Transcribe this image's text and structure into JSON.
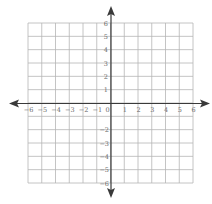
{
  "chart_data": {
    "type": "coordinate-plane",
    "title": "",
    "xlabel": "",
    "ylabel": "",
    "xlim": [
      -6,
      6
    ],
    "ylim": [
      -6,
      6
    ],
    "grid": true,
    "x_ticks": [
      "−6",
      "−5",
      "−4",
      "−3",
      "−2",
      "−1",
      "0",
      "1",
      "2",
      "3",
      "4",
      "5",
      "6"
    ],
    "y_ticks_positive": [
      "1",
      "2",
      "3",
      "4",
      "5",
      "6"
    ],
    "y_ticks_negative": [
      "−2",
      "−3",
      "−4",
      "−5",
      "−6"
    ],
    "axes_arrows": true
  },
  "colors": {
    "grid": "#b5b5b5",
    "axis": "#3a3a3a",
    "label": "#6a6a6a"
  }
}
